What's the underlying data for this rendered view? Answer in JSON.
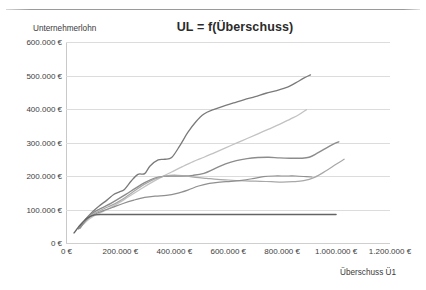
{
  "chart_data": {
    "type": "line",
    "title": "UL = f(Überschuss)",
    "xlabel": "Überschuss Ü1",
    "ylabel": "Unternehmerlohn",
    "xlim": [
      0,
      1200000
    ],
    "ylim": [
      0,
      600000
    ],
    "grid": true,
    "legend": "none",
    "xticks": [
      "0 €",
      "200.000 €",
      "400.000 €",
      "600.000 €",
      "800.000 €",
      "1.000.000 €",
      "1.200.000 €"
    ],
    "xtick_values": [
      0,
      200000,
      400000,
      600000,
      800000,
      1000000,
      1200000
    ],
    "yticks": [
      "0 €",
      "100.000 €",
      "200.000 €",
      "300.000 €",
      "400.000 €",
      "500.000 €",
      "600.000 €"
    ],
    "ytick_values": [
      0,
      100000,
      200000,
      300000,
      400000,
      500000,
      600000
    ],
    "series": [
      {
        "name": "series-1",
        "color": "#7a7a7a",
        "width": 1.3,
        "points": [
          [
            45000,
            42000
          ],
          [
            70000,
            70000
          ],
          [
            95000,
            92000
          ],
          [
            120000,
            110000
          ],
          [
            150000,
            128000
          ],
          [
            175000,
            145000
          ],
          [
            195000,
            152000
          ],
          [
            215000,
            160000
          ],
          [
            240000,
            185000
          ],
          [
            265000,
            205000
          ],
          [
            290000,
            207000
          ],
          [
            310000,
            230000
          ],
          [
            340000,
            248000
          ],
          [
            365000,
            250000
          ],
          [
            390000,
            255000
          ],
          [
            420000,
            290000
          ],
          [
            450000,
            330000
          ],
          [
            480000,
            362000
          ],
          [
            510000,
            385000
          ],
          [
            545000,
            398000
          ],
          [
            580000,
            408000
          ],
          [
            620000,
            418000
          ],
          [
            660000,
            428000
          ],
          [
            700000,
            437000
          ],
          [
            740000,
            447000
          ],
          [
            780000,
            455000
          ],
          [
            820000,
            465000
          ],
          [
            850000,
            478000
          ],
          [
            880000,
            492000
          ],
          [
            905000,
            502000
          ]
        ]
      },
      {
        "name": "series-2",
        "color": "#c2c2c2",
        "width": 1.3,
        "points": [
          [
            48000,
            44000
          ],
          [
            75000,
            66000
          ],
          [
            100000,
            80000
          ],
          [
            130000,
            92000
          ],
          [
            160000,
            104000
          ],
          [
            195000,
            120000
          ],
          [
            230000,
            138000
          ],
          [
            270000,
            158000
          ],
          [
            310000,
            178000
          ],
          [
            350000,
            196000
          ],
          [
            390000,
            212000
          ],
          [
            430000,
            228000
          ],
          [
            470000,
            243000
          ],
          [
            510000,
            256000
          ],
          [
            550000,
            270000
          ],
          [
            590000,
            284000
          ],
          [
            630000,
            298000
          ],
          [
            670000,
            312000
          ],
          [
            710000,
            326000
          ],
          [
            750000,
            340000
          ],
          [
            790000,
            354000
          ],
          [
            830000,
            370000
          ],
          [
            860000,
            382000
          ],
          [
            890000,
            398000
          ]
        ]
      },
      {
        "name": "series-3",
        "color": "#8c8c8c",
        "width": 1.4,
        "points": [
          [
            48000,
            44000
          ],
          [
            72000,
            72000
          ],
          [
            95000,
            88000
          ],
          [
            120000,
            100000
          ],
          [
            150000,
            112000
          ],
          [
            185000,
            128000
          ],
          [
            220000,
            145000
          ],
          [
            255000,
            163000
          ],
          [
            290000,
            180000
          ],
          [
            325000,
            193000
          ],
          [
            360000,
            199000
          ],
          [
            395000,
            200000
          ],
          [
            430000,
            200000
          ],
          [
            470000,
            202000
          ],
          [
            510000,
            208000
          ],
          [
            550000,
            222000
          ],
          [
            590000,
            236000
          ],
          [
            630000,
            246000
          ],
          [
            670000,
            252000
          ],
          [
            710000,
            255000
          ],
          [
            750000,
            256000
          ],
          [
            790000,
            254000
          ],
          [
            830000,
            253000
          ],
          [
            870000,
            253000
          ],
          [
            900000,
            256000
          ],
          [
            930000,
            268000
          ],
          [
            960000,
            282000
          ],
          [
            990000,
            295000
          ],
          [
            1010000,
            302000
          ]
        ]
      },
      {
        "name": "series-4",
        "color": "#a8a8a8",
        "width": 1.2,
        "points": [
          [
            50000,
            44000
          ],
          [
            74000,
            70000
          ],
          [
            98000,
            86000
          ],
          [
            125000,
            97000
          ],
          [
            155000,
            108000
          ],
          [
            190000,
            122000
          ],
          [
            225000,
            140000
          ],
          [
            260000,
            160000
          ],
          [
            295000,
            178000
          ],
          [
            330000,
            192000
          ],
          [
            365000,
            200000
          ],
          [
            400000,
            203000
          ],
          [
            440000,
            200000
          ],
          [
            480000,
            196000
          ],
          [
            520000,
            193000
          ],
          [
            560000,
            190000
          ],
          [
            600000,
            188000
          ],
          [
            640000,
            186000
          ],
          [
            680000,
            185000
          ],
          [
            720000,
            184000
          ],
          [
            760000,
            183000
          ],
          [
            800000,
            182000
          ],
          [
            840000,
            183000
          ],
          [
            880000,
            186000
          ],
          [
            920000,
            196000
          ],
          [
            960000,
            214000
          ],
          [
            1000000,
            235000
          ],
          [
            1030000,
            250000
          ]
        ]
      },
      {
        "name": "series-5",
        "color": "#8f8f8f",
        "width": 1.2,
        "points": [
          [
            50000,
            45000
          ],
          [
            78000,
            72000
          ],
          [
            105000,
            86000
          ],
          [
            135000,
            96000
          ],
          [
            170000,
            106000
          ],
          [
            210000,
            118000
          ],
          [
            250000,
            128000
          ],
          [
            290000,
            136000
          ],
          [
            330000,
            140000
          ],
          [
            370000,
            142000
          ],
          [
            410000,
            148000
          ],
          [
            450000,
            158000
          ],
          [
            490000,
            170000
          ],
          [
            530000,
            178000
          ],
          [
            570000,
            182000
          ],
          [
            610000,
            184000
          ],
          [
            650000,
            187000
          ],
          [
            690000,
            192000
          ],
          [
            730000,
            198000
          ],
          [
            770000,
            200000
          ],
          [
            810000,
            200000
          ],
          [
            850000,
            200000
          ],
          [
            890000,
            198000
          ],
          [
            910000,
            197000
          ]
        ]
      },
      {
        "name": "series-6",
        "color": "#646464",
        "width": 1.4,
        "points": [
          [
            28000,
            30000
          ],
          [
            45000,
            48000
          ],
          [
            60000,
            62000
          ],
          [
            80000,
            76000
          ],
          [
            105000,
            84000
          ],
          [
            140000,
            85000
          ],
          [
            200000,
            85000
          ],
          [
            300000,
            85000
          ],
          [
            400000,
            85000
          ],
          [
            500000,
            85000
          ],
          [
            600000,
            85000
          ],
          [
            700000,
            85000
          ],
          [
            800000,
            85000
          ],
          [
            900000,
            85000
          ],
          [
            980000,
            85000
          ],
          [
            1000000,
            85000
          ]
        ]
      }
    ]
  }
}
